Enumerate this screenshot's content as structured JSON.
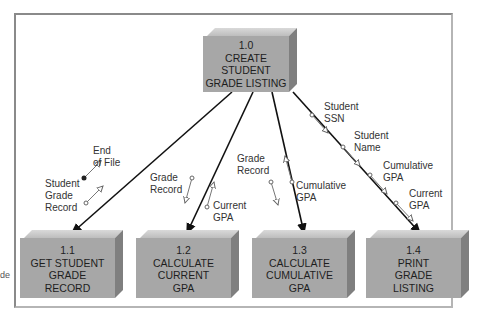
{
  "diagram": {
    "type": "structure chart",
    "root": {
      "id": "1.0",
      "lines": [
        "1.0",
        "CREATE",
        "STUDENT",
        "GRADE LISTING"
      ]
    },
    "modules": [
      {
        "id": "1.1",
        "lines": [
          "1.1",
          "GET STUDENT",
          "GRADE",
          "RECORD"
        ]
      },
      {
        "id": "1.2",
        "lines": [
          "1.2",
          "CALCULATE",
          "CURRENT",
          "GPA"
        ]
      },
      {
        "id": "1.3",
        "lines": [
          "1.3",
          "CALCULATE",
          "CUMULATIVE",
          "GPA"
        ]
      },
      {
        "id": "1.4",
        "lines": [
          "1.4",
          "PRINT",
          "GRADE",
          "LISTING"
        ]
      }
    ],
    "couples": {
      "m11": [
        {
          "lines": [
            "End",
            "of File"
          ],
          "kind": "control",
          "direction": "up"
        },
        {
          "lines": [
            "Student",
            "Grade",
            "Record"
          ],
          "kind": "data",
          "direction": "up"
        }
      ],
      "m12": [
        {
          "lines": [
            "Grade",
            "Record"
          ],
          "kind": "data",
          "direction": "down"
        },
        {
          "lines": [
            "Current",
            "GPA"
          ],
          "kind": "data",
          "direction": "up"
        }
      ],
      "m13": [
        {
          "lines": [
            "Grade",
            "Record"
          ],
          "kind": "data",
          "direction": "down"
        },
        {
          "lines": [
            "Cumulative",
            "GPA"
          ],
          "kind": "data",
          "direction": "up"
        }
      ],
      "m14": [
        {
          "lines": [
            "Student",
            "SSN"
          ],
          "kind": "data",
          "direction": "down"
        },
        {
          "lines": [
            "Student",
            "Name"
          ],
          "kind": "data",
          "direction": "down"
        },
        {
          "lines": [
            "Cumulative",
            "GPA"
          ],
          "kind": "data",
          "direction": "down"
        },
        {
          "lines": [
            "Current",
            "GPA"
          ],
          "kind": "data",
          "direction": "down"
        }
      ]
    },
    "margin_note": "de"
  },
  "colors": {
    "box": "#a7a7a7",
    "box_top": "#d0d0d0",
    "box_side": "#7f7f7f",
    "frame": "#8a8a8a",
    "line": "#111111"
  }
}
